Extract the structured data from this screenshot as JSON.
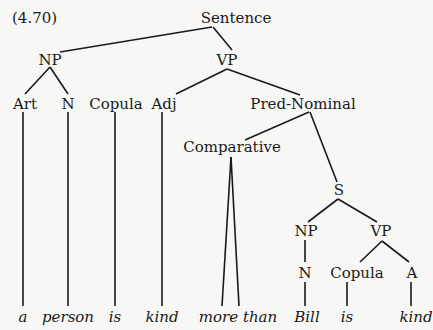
{
  "example_number": "(4.70)",
  "nodes": {
    "root": "Sentence",
    "np1": "NP",
    "vp1": "VP",
    "art": "Art",
    "n1": "N",
    "copula1": "Copula",
    "adj": "Adj",
    "pred_nominal": "Pred-Nominal",
    "comparative": "Comparative",
    "s": "S",
    "np2": "NP",
    "vp2": "VP",
    "n2": "N",
    "copula2": "Copula",
    "a": "A"
  },
  "leaves": {
    "w1": "a",
    "w2": "person",
    "w3": "is",
    "w4": "kind",
    "w5": "more than",
    "w6": "Bill",
    "w7": "is",
    "w8": "kind"
  },
  "colors": {
    "ink": "#1a1a1a",
    "paper": "#f7f7f5"
  }
}
